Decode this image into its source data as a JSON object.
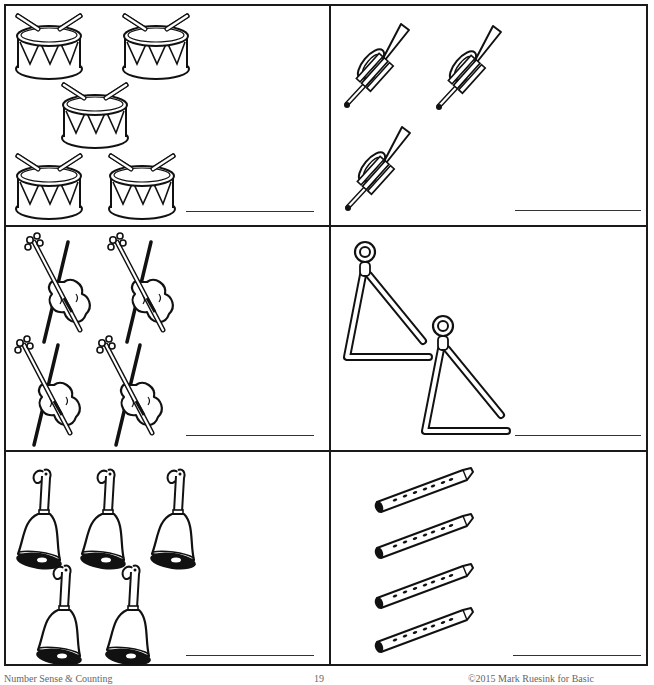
{
  "worksheet": {
    "title": "Count the musical instruments",
    "cells": [
      {
        "id": "drums",
        "instrument": "drum",
        "count": 5,
        "answer": ""
      },
      {
        "id": "trumpets",
        "instrument": "trumpet",
        "count": 3,
        "answer": ""
      },
      {
        "id": "violins",
        "instrument": "violin",
        "count": 4,
        "answer": ""
      },
      {
        "id": "triangles",
        "instrument": "triangle",
        "count": 2,
        "answer": ""
      },
      {
        "id": "bells",
        "instrument": "hand bell",
        "count": 5,
        "answer": ""
      },
      {
        "id": "recorders",
        "instrument": "recorder",
        "count": 4,
        "answer": ""
      }
    ]
  },
  "footer": {
    "left": "Number Sense & Counting",
    "page": "19",
    "right": "©2015 Mark Ruesink for Basic"
  }
}
